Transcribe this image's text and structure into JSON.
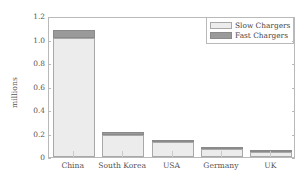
{
  "chart_data": {
    "type": "bar",
    "stacked": true,
    "title": "",
    "xlabel": "",
    "ylabel": "millions",
    "categories": [
      "China",
      "South Korea",
      "USA",
      "Germany",
      "UK"
    ],
    "series": [
      {
        "name": "Slow Chargers",
        "values": [
          1.01,
          0.185,
          0.125,
          0.072,
          0.045
        ],
        "color": "#ececec"
      },
      {
        "name": "Fast Chargers",
        "values": [
          0.07,
          0.025,
          0.022,
          0.01,
          0.007
        ],
        "color": "#9a9a9a"
      }
    ],
    "totals": [
      1.08,
      0.21,
      0.147,
      0.082,
      0.052
    ],
    "ylim": [
      0,
      1.2
    ],
    "ytick_values": [
      0,
      0.2,
      0.4,
      0.6,
      0.8,
      1.0,
      1.2
    ],
    "ytick_labels": [
      "0",
      "0.2",
      "0.4",
      "0.6",
      "0.8",
      "1.0",
      "1.2"
    ],
    "grid": false,
    "legend_position": "top-right",
    "legend_entries": [
      "Slow Chargers",
      "Fast Chargers"
    ]
  }
}
